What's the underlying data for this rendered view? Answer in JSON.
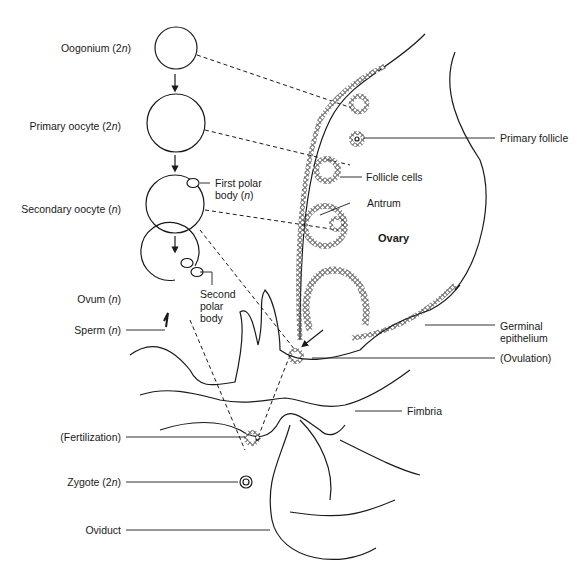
{
  "diagram": {
    "stages": [
      {
        "name": "Oogonium",
        "ploidy": "2n"
      },
      {
        "name": "Primary oocyte",
        "ploidy": "2n"
      },
      {
        "name": "Secondary oocyte",
        "ploidy": "n"
      },
      {
        "name": "Ovum",
        "ploidy": "n"
      },
      {
        "name": "Sperm",
        "ploidy": "n"
      },
      {
        "name": "Zygote",
        "ploidy": "2n"
      }
    ],
    "labels": {
      "oogonium": "Oogonium (2",
      "primary_oocyte": "Primary oocyte (2",
      "secondary_oocyte": "Secondary oocyte (",
      "ovum": "Ovum (",
      "sperm": "Sperm (",
      "fertilization": "(Fertilization)",
      "zygote": "Zygote (2",
      "oviduct": "Oviduct",
      "first_polar_body_1": "First polar",
      "first_polar_body_2": "body (",
      "second_polar_body_1": "Second",
      "second_polar_body_2": "polar",
      "second_polar_body_3": "body",
      "primary_follicle": "Primary follicle",
      "follicle_cells": "Follicle cells",
      "antrum": "Antrum",
      "ovary": "Ovary",
      "germinal_epithelium_1": "Germinal",
      "germinal_epithelium_2": "epithelium",
      "ovulation": "(Ovulation)",
      "fimbria": "Fimbria",
      "n": "n",
      "close": ")"
    },
    "colors": {
      "line": "#1a1a1a",
      "background": "#ffffff"
    }
  }
}
